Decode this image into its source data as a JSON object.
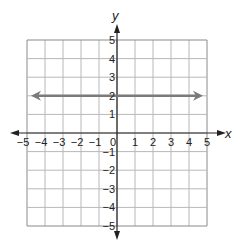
{
  "chart_data": {
    "type": "line",
    "title": "",
    "xlabel": "x",
    "ylabel": "y",
    "xlim": [
      -5,
      5
    ],
    "ylim": [
      -5,
      5
    ],
    "grid": true,
    "x_ticks": [
      -5,
      -4,
      -3,
      -2,
      -1,
      0,
      1,
      2,
      3,
      4,
      5
    ],
    "y_ticks": [
      -5,
      -4,
      -3,
      -2,
      -1,
      1,
      2,
      3,
      4,
      5
    ],
    "x_tick_labels": [
      "−5",
      "−4",
      "−3",
      "−2",
      "−1",
      "0",
      "1",
      "2",
      "3",
      "4",
      "5"
    ],
    "y_tick_labels": [
      "−5",
      "−4",
      "−3",
      "−2",
      "−1",
      "1",
      "2",
      "3",
      "4",
      "5"
    ],
    "series": [
      {
        "name": "y = 2",
        "x": [
          -5,
          5
        ],
        "y": [
          2,
          2
        ],
        "arrows_both_ends": true,
        "color": "#7a7a7a"
      }
    ],
    "legend": null
  },
  "colors": {
    "grid": "#b8b8b8",
    "grid_border": "#8a8a8a",
    "axis": "#222222",
    "line": "#7a7a7a"
  }
}
